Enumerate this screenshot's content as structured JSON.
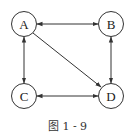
{
  "diagram": {
    "caption": "图 1 - 9",
    "nodes": [
      {
        "id": "A",
        "label": "A",
        "cx": 24,
        "cy": 24
      },
      {
        "id": "B",
        "label": "B",
        "cx": 111,
        "cy": 24
      },
      {
        "id": "C",
        "label": "C",
        "cx": 24,
        "cy": 96
      },
      {
        "id": "D",
        "label": "D",
        "cx": 111,
        "cy": 96
      }
    ],
    "edges": [
      {
        "from": "A",
        "to": "B",
        "bidirectional": true
      },
      {
        "from": "A",
        "to": "C",
        "bidirectional": true
      },
      {
        "from": "B",
        "to": "D",
        "bidirectional": true
      },
      {
        "from": "C",
        "to": "D",
        "bidirectional": true
      },
      {
        "from": "A",
        "to": "D",
        "bidirectional": false
      }
    ],
    "colors": {
      "stroke": "#333333",
      "background": "#ffffff"
    }
  }
}
